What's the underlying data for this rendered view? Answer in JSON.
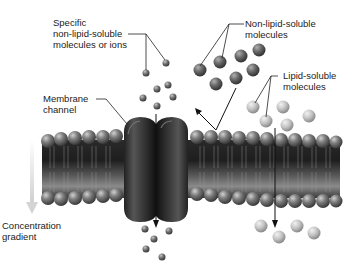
{
  "labels": {
    "specific": [
      "Specific",
      "non-lipid-soluble",
      "molecules or ions"
    ],
    "non_lipid": [
      "Non-lipid-soluble",
      "molecules"
    ],
    "lipid": [
      "Lipid-soluble",
      "molecules"
    ],
    "channel": [
      "Membrane",
      "channel"
    ],
    "gradient": [
      "Concentration",
      "gradient"
    ]
  },
  "colors": {
    "background": "#ffffff",
    "membrane_dark": "#2a2a2a",
    "head_gray": "#7a7a7a",
    "channel": "#3a3a3a",
    "ion": "#6e6e6e",
    "non_lipid": "#6a6a6a",
    "lipid": "#c4c4c4",
    "gradient_arrow": "#d8d8d8"
  }
}
